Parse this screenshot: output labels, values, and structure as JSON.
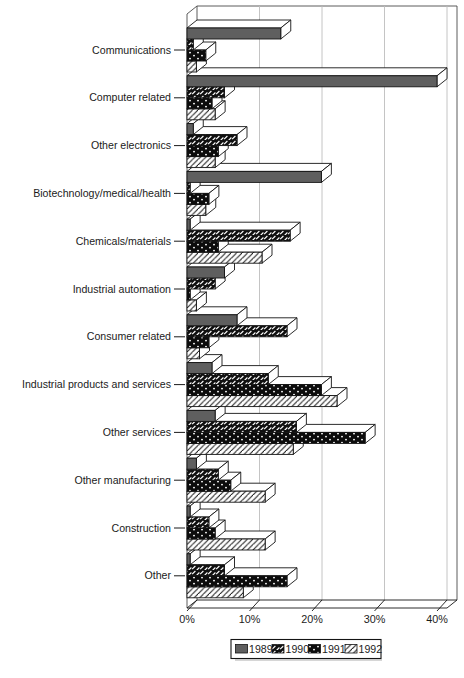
{
  "chart_data": {
    "type": "bar",
    "orientation": "horizontal",
    "categories": [
      "Communications",
      "Computer related",
      "Other electronics",
      "Biotechnology/medical/health",
      "Chemicals/materials",
      "Industrial automation",
      "Consumer related",
      "Industrial products and services",
      "Other services",
      "Other manufacturing",
      "Construction",
      "Other"
    ],
    "series": [
      {
        "name": "1989",
        "pattern": "solid-gray",
        "values": [
          15,
          40,
          1,
          21.5,
          0.5,
          6,
          8,
          4,
          4.5,
          1.5,
          0.5,
          0.5
        ]
      },
      {
        "name": "1990",
        "pattern": "scale-dashes",
        "values": [
          1,
          6,
          8,
          0.5,
          16.5,
          4.5,
          16,
          13,
          17.5,
          5,
          3.5,
          6
        ]
      },
      {
        "name": "1991",
        "pattern": "black-dots",
        "values": [
          3,
          4,
          5,
          3.5,
          5,
          0.5,
          3.5,
          21.5,
          28.5,
          7,
          4.5,
          16
        ]
      },
      {
        "name": "1992",
        "pattern": "diagonal-hatch",
        "values": [
          1.5,
          4.5,
          4.5,
          3,
          12,
          1.5,
          2,
          24,
          17,
          12.5,
          12.5,
          9
        ]
      }
    ],
    "x_ticks": [
      {
        "label": "0%",
        "value": 0
      },
      {
        "label": "10%",
        "value": 10
      },
      {
        "label": "20%",
        "value": 20
      },
      {
        "label": "30%",
        "value": 30
      },
      {
        "label": "40%",
        "value": 40
      }
    ],
    "xlim": [
      0,
      40
    ],
    "grid": true,
    "legend_position": "bottom-center",
    "legend_items": [
      "1989",
      "1990",
      "1991",
      "1992"
    ]
  },
  "colors": {
    "bar_gray": "#5f5f5f",
    "ink": "#141414",
    "frame": "#4a4a4a",
    "grid": "#bdbdbd",
    "text": "#1b1b1b",
    "background": "#ffffff"
  }
}
